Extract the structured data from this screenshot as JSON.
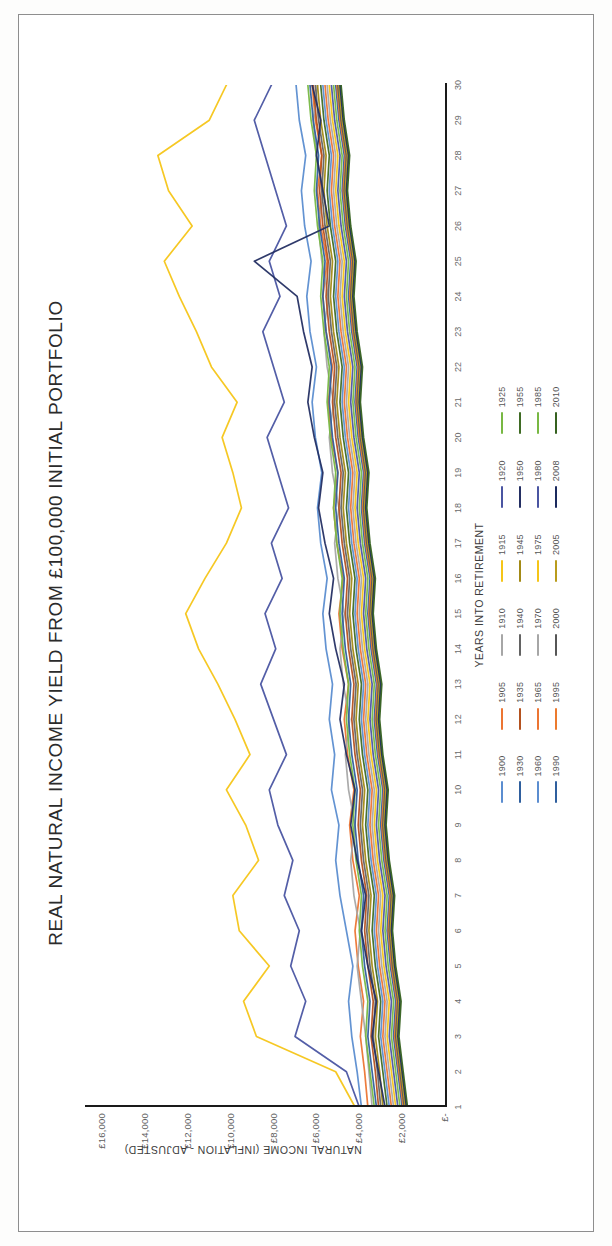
{
  "chart_data": {
    "type": "line",
    "title": "REAL NATURAL INCOME YIELD FROM £100,000 INITIAL PORTFOLIO",
    "xlabel": "YEARS INTO RETIREMENT",
    "ylabel": "NATURAL INCOME (INFLATION - ADJUSTED)",
    "x": [
      1,
      2,
      3,
      4,
      5,
      6,
      7,
      8,
      9,
      10,
      11,
      12,
      13,
      14,
      15,
      16,
      17,
      18,
      19,
      20,
      21,
      22,
      23,
      24,
      25,
      26,
      27,
      28,
      29,
      30
    ],
    "xtick_labels": [
      "1",
      "2",
      "3",
      "4",
      "5",
      "6",
      "7",
      "8",
      "9",
      "10",
      "11",
      "12",
      "13",
      "14",
      "15",
      "16",
      "17",
      "18",
      "19",
      "20",
      "21",
      "22",
      "23",
      "24",
      "25",
      "26",
      "27",
      "28",
      "29",
      "30"
    ],
    "ytick_labels": [
      "£-",
      "£2,000",
      "£4,000",
      "£6,000",
      "£8,000",
      "£10,000",
      "£12,000",
      "£14,000",
      "£16,000"
    ],
    "ytick_values": [
      0,
      2000,
      4000,
      6000,
      8000,
      10000,
      12000,
      14000,
      16000
    ],
    "ylim": [
      0,
      16800
    ],
    "xlim": [
      1,
      30
    ],
    "grid": false,
    "legend_position": "bottom",
    "palette": [
      "#5b8dd0",
      "#ec7533",
      "#a6a6a6",
      "#f5c518",
      "#4a55a2",
      "#78b843",
      "#2f5f9e",
      "#b4521f",
      "#636363",
      "#a38a16",
      "#242f63",
      "#3f6b24",
      "#5b8dd0",
      "#ec7533",
      "#a6a6a6",
      "#f5c518",
      "#4a55a2",
      "#78b843",
      "#2f5f9e",
      "#ec7a2e",
      "#565656",
      "#b99c1c",
      "#1b2a5e",
      "#35611f"
    ],
    "series": [
      {
        "name": "1900",
        "color": "#5b8dd0",
        "values": [
          3900,
          4100,
          4350,
          4500,
          4300,
          4600,
          4900,
          5100,
          4950,
          5300,
          5150,
          5400,
          5250,
          5550,
          5700,
          5500,
          5800,
          5950,
          5750,
          6050,
          6200,
          6000,
          6300,
          6450,
          6250,
          6550,
          6700,
          6500,
          6800,
          6950
        ]
      },
      {
        "name": "1905",
        "color": "#ec7533",
        "values": [
          3600,
          3750,
          3950,
          3800,
          4050,
          4200,
          4000,
          4300,
          4450,
          4250,
          4550,
          4700,
          4500,
          4800,
          4950,
          4750,
          5050,
          5200,
          5000,
          5300,
          5450,
          5250,
          5550,
          5700,
          5500,
          5800,
          5950,
          5750,
          6050,
          6200
        ]
      },
      {
        "name": "1910",
        "color": "#a6a6a6",
        "values": [
          3400,
          3550,
          3700,
          3900,
          4100,
          3950,
          4250,
          4400,
          4200,
          4500,
          4650,
          4450,
          4750,
          4900,
          4700,
          5000,
          5150,
          4950,
          5250,
          5400,
          5200,
          5500,
          5650,
          5450,
          5750,
          5900,
          5700,
          6000,
          6150,
          5950
        ]
      },
      {
        "name": "1915",
        "color": "#f5c518",
        "values": [
          4200,
          5100,
          8800,
          9400,
          8200,
          9600,
          9900,
          8700,
          9300,
          10200,
          9100,
          9800,
          10600,
          11500,
          12100,
          11200,
          10200,
          9500,
          9900,
          10400,
          9700,
          10900,
          11600,
          12400,
          13100,
          11800,
          12900,
          13400,
          11000,
          10200
        ]
      },
      {
        "name": "1920",
        "color": "#4a55a2",
        "values": [
          4000,
          4600,
          7000,
          6500,
          7200,
          6800,
          7500,
          7100,
          7800,
          8200,
          7400,
          8000,
          8600,
          7900,
          8400,
          7600,
          8100,
          7300,
          7800,
          8300,
          7500,
          8000,
          8500,
          7700,
          8200,
          7400,
          7900,
          8400,
          8900,
          8100
        ]
      },
      {
        "name": "1925",
        "color": "#78b843",
        "values": [
          3300,
          3500,
          3700,
          3600,
          3850,
          4000,
          3900,
          4150,
          4300,
          4200,
          4450,
          4600,
          4500,
          4750,
          4900,
          4800,
          5050,
          5200,
          5100,
          5350,
          5500,
          5400,
          5650,
          5800,
          5700,
          5950,
          6100,
          6000,
          6250,
          6400
        ]
      },
      {
        "name": "1930",
        "color": "#2f5f9e",
        "values": [
          3200,
          3400,
          3600,
          3500,
          3750,
          3900,
          3800,
          4050,
          4200,
          4100,
          4350,
          4500,
          4400,
          4650,
          4800,
          4700,
          4950,
          5100,
          5000,
          5250,
          5400,
          5300,
          5550,
          5700,
          5600,
          5850,
          6000,
          5900,
          6150,
          6300
        ]
      },
      {
        "name": "1935",
        "color": "#b4521f",
        "values": [
          3100,
          3250,
          3450,
          3350,
          3600,
          3750,
          3650,
          3900,
          4050,
          3950,
          4200,
          4350,
          4250,
          4500,
          4650,
          4550,
          4800,
          4950,
          4850,
          5100,
          5250,
          5150,
          5400,
          5550,
          5450,
          5700,
          5850,
          5750,
          6000,
          6150
        ]
      },
      {
        "name": "1940",
        "color": "#636363",
        "values": [
          3000,
          3150,
          3350,
          3250,
          3500,
          3650,
          3550,
          3800,
          3950,
          3850,
          4100,
          4250,
          4150,
          4400,
          4550,
          4450,
          4700,
          4850,
          4750,
          5000,
          5150,
          5050,
          5300,
          5450,
          5350,
          5600,
          5750,
          5650,
          5900,
          6050
        ]
      },
      {
        "name": "1945",
        "color": "#a38a16",
        "values": [
          2900,
          3050,
          3250,
          3150,
          3400,
          3550,
          3450,
          3700,
          3850,
          3750,
          4000,
          4150,
          4050,
          4300,
          4450,
          4350,
          4600,
          4750,
          4650,
          4900,
          5050,
          4950,
          5200,
          5350,
          5250,
          5500,
          5650,
          5550,
          5800,
          5950
        ]
      },
      {
        "name": "1950",
        "color": "#242f63",
        "values": [
          2800,
          3100,
          3400,
          3200,
          3600,
          3900,
          3700,
          4100,
          4400,
          4200,
          4600,
          4900,
          4700,
          5100,
          5400,
          5200,
          5600,
          5900,
          5700,
          6100,
          6400,
          6200,
          6600,
          6900,
          8900,
          5400,
          5700,
          6000,
          5800,
          6200
        ]
      },
      {
        "name": "1955",
        "color": "#3f6b24",
        "values": [
          2700,
          2900,
          3100,
          3000,
          3250,
          3400,
          3300,
          3550,
          3700,
          3600,
          3850,
          4000,
          3900,
          4150,
          4300,
          4200,
          4450,
          4600,
          4500,
          4750,
          4900,
          4800,
          5050,
          5200,
          5100,
          5350,
          5500,
          5400,
          5650,
          5800
        ]
      },
      {
        "name": "1960",
        "color": "#5b8dd0",
        "values": [
          2600,
          2800,
          3000,
          2900,
          3150,
          3300,
          3200,
          3450,
          3600,
          3500,
          3750,
          3900,
          3800,
          4050,
          4200,
          4100,
          4350,
          4500,
          4400,
          4650,
          4800,
          4700,
          4950,
          5100,
          5000,
          5250,
          5400,
          5300,
          5550,
          5700
        ]
      },
      {
        "name": "1965",
        "color": "#ec7533",
        "values": [
          2500,
          2700,
          2900,
          2800,
          3050,
          3200,
          3100,
          3350,
          3500,
          3400,
          3650,
          3800,
          3700,
          3950,
          4100,
          4000,
          4250,
          4400,
          4300,
          4550,
          4700,
          4600,
          4850,
          5000,
          4900,
          5150,
          5300,
          5200,
          5450,
          5600
        ]
      },
      {
        "name": "1970",
        "color": "#a6a6a6",
        "values": [
          2400,
          2600,
          2800,
          2700,
          2950,
          3100,
          3000,
          3250,
          3400,
          3300,
          3550,
          3700,
          3600,
          3850,
          4000,
          3900,
          4150,
          4300,
          4200,
          4450,
          4600,
          4500,
          4750,
          4900,
          4800,
          5050,
          5200,
          5100,
          5350,
          5500
        ]
      },
      {
        "name": "1975",
        "color": "#f5c518",
        "values": [
          2300,
          2500,
          2700,
          2600,
          2850,
          3000,
          2900,
          3150,
          3300,
          3200,
          3450,
          3600,
          3500,
          3750,
          3900,
          3800,
          4050,
          4200,
          4100,
          4350,
          4500,
          4400,
          4650,
          4800,
          4700,
          4950,
          5100,
          5000,
          5250,
          5400
        ]
      },
      {
        "name": "1980",
        "color": "#4a55a2",
        "values": [
          2200,
          2400,
          2600,
          2500,
          2750,
          2900,
          2800,
          3050,
          3200,
          3100,
          3350,
          3500,
          3400,
          3650,
          3800,
          3700,
          3950,
          4100,
          4000,
          4250,
          4400,
          4300,
          4550,
          4700,
          4600,
          4850,
          5000,
          4900,
          5150,
          5300
        ]
      },
      {
        "name": "1985",
        "color": "#78b843",
        "values": [
          2100,
          2300,
          2500,
          2400,
          2650,
          2800,
          2700,
          2950,
          3100,
          3000,
          3250,
          3400,
          3300,
          3550,
          3700,
          3600,
          3850,
          4000,
          3900,
          4150,
          4300,
          4200,
          4450,
          4600,
          4500,
          4750,
          4900,
          4800,
          5050,
          5200
        ]
      },
      {
        "name": "1990",
        "color": "#2f5f9e",
        "values": [
          2000,
          2200,
          2400,
          2300,
          2550,
          2700,
          2600,
          2850,
          3000,
          2900,
          3150,
          3300,
          3200,
          3450,
          3600,
          3500,
          3750,
          3900,
          3800,
          4050,
          4200,
          4100,
          4350,
          4500,
          4400,
          4650,
          4800,
          4700,
          4950,
          5100
        ]
      },
      {
        "name": "1995",
        "color": "#ec7a2e",
        "values": [
          1950,
          2150,
          2350,
          2250,
          2500,
          2650,
          2550,
          2800,
          2950,
          2850,
          3100,
          3250,
          3150,
          3400,
          3550,
          3450,
          3700,
          3850,
          3750,
          4000,
          4150,
          4050,
          4300,
          4450,
          4350,
          4600,
          4750,
          4650,
          4900,
          5050
        ]
      },
      {
        "name": "2000",
        "color": "#565656",
        "values": [
          1900,
          2100,
          2300,
          2200,
          2450,
          2600,
          2500,
          2750,
          2900,
          2800,
          3050,
          3200,
          3100,
          3350,
          3500,
          3400,
          3650,
          3800,
          3700,
          3950,
          4100,
          4000,
          4250,
          4400,
          4300,
          4550,
          4700,
          4600,
          4850,
          5000
        ]
      },
      {
        "name": "2005",
        "color": "#b99c1c",
        "values": [
          1850,
          2050,
          2250,
          2150,
          2400,
          2550,
          2450,
          2700,
          2850,
          2750,
          3000,
          3150,
          3050,
          3300,
          3450,
          3350,
          3600,
          3750,
          3650,
          3900,
          4050,
          3950,
          4200,
          4350,
          4250,
          4500,
          4650,
          4550,
          4800,
          4950
        ]
      },
      {
        "name": "2008",
        "color": "#1b2a5e",
        "values": [
          1800,
          2000,
          2200,
          2100,
          2350,
          2500,
          2400,
          2650,
          2800,
          2700,
          2950,
          3100,
          3000,
          3250,
          3400,
          3300,
          3550,
          3700,
          3600,
          3850,
          4000,
          3900,
          4150,
          4300,
          4200,
          4450,
          4600,
          4500,
          4750,
          4900
        ]
      },
      {
        "name": "2010",
        "color": "#35611f",
        "values": [
          1750,
          1950,
          2150,
          2050,
          2300,
          2450,
          2350,
          2600,
          2750,
          2650,
          2900,
          3050,
          2950,
          3200,
          3350,
          3250,
          3500,
          3650,
          3550,
          3800,
          3950,
          3850,
          4100,
          4250,
          4150,
          4400,
          4550,
          4450,
          4700,
          4850
        ]
      }
    ]
  },
  "legend_rows": [
    [
      "1900",
      "1905",
      "1910",
      "1915",
      "1920",
      "1925"
    ],
    [
      "1930",
      "1935",
      "1940",
      "1945",
      "1950",
      "1955"
    ],
    [
      "1960",
      "1965",
      "1970",
      "1975",
      "1980",
      "1985"
    ],
    [
      "1990",
      "1995",
      "2000",
      "2005",
      "2008",
      "2010"
    ]
  ]
}
